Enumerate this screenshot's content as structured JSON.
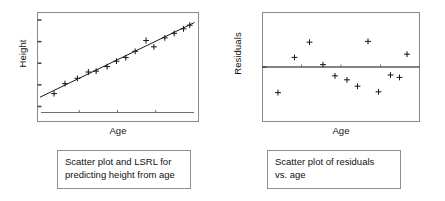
{
  "figure": {
    "stroke_color": "#1a1a1a",
    "frame_color": "#8a8a8a",
    "background": "#ffffff"
  },
  "panels": [
    {
      "id": "scatter-lsrl",
      "xlabel": "Age",
      "ylabel": "Height",
      "caption_line1": "Scatter plot and LSRL for",
      "caption_line2": "predicting height from age"
    },
    {
      "id": "residual-plot",
      "xlabel": "Age",
      "ylabel": "Residuals",
      "caption_line1": "Scatter plot of residuals",
      "caption_line2": "vs. age"
    }
  ],
  "chart_data": [
    {
      "type": "scatter",
      "id": "scatter-lsrl",
      "title": "Scatter plot and LSRL for predicting height from age",
      "xlabel": "Age",
      "ylabel": "Height",
      "xlim": [
        0,
        100
      ],
      "ylim": [
        0,
        100
      ],
      "grid": false,
      "legend": null,
      "axis_ticks": {
        "y_tick_count": 5,
        "x_tick_count": 3,
        "tick_labels_shown": false
      },
      "marker": "plus",
      "points": [
        {
          "x": 9,
          "y": 16
        },
        {
          "x": 16,
          "y": 27
        },
        {
          "x": 24,
          "y": 33
        },
        {
          "x": 31,
          "y": 40
        },
        {
          "x": 36,
          "y": 41
        },
        {
          "x": 43,
          "y": 46
        },
        {
          "x": 49,
          "y": 52
        },
        {
          "x": 55,
          "y": 56
        },
        {
          "x": 61,
          "y": 63
        },
        {
          "x": 68,
          "y": 75
        },
        {
          "x": 73,
          "y": 68
        },
        {
          "x": 80,
          "y": 78
        },
        {
          "x": 86,
          "y": 83
        },
        {
          "x": 92,
          "y": 88
        },
        {
          "x": 96,
          "y": 92
        }
      ],
      "fit_line": {
        "name": "LSRL",
        "x_start": 0,
        "y_start": 12,
        "x_end": 99,
        "y_end": 95
      }
    },
    {
      "type": "scatter",
      "id": "residual-plot",
      "title": "Scatter plot of residuals vs. age",
      "xlabel": "Age",
      "ylabel": "Residuals",
      "xlim": [
        0,
        100
      ],
      "ylim": [
        -50,
        50
      ],
      "grid": false,
      "legend": null,
      "axis_ticks": {
        "y_tick_count": 1,
        "x_tick_count": 3,
        "tick_labels_shown": false
      },
      "marker": "plus",
      "zero_line": 0,
      "points": [
        {
          "x": 8,
          "y": -32
        },
        {
          "x": 19,
          "y": 12
        },
        {
          "x": 29,
          "y": 31
        },
        {
          "x": 38,
          "y": 3
        },
        {
          "x": 46,
          "y": -11
        },
        {
          "x": 54,
          "y": -16
        },
        {
          "x": 61,
          "y": -24
        },
        {
          "x": 68,
          "y": 32
        },
        {
          "x": 75,
          "y": -31
        },
        {
          "x": 83,
          "y": -10
        },
        {
          "x": 89,
          "y": -13
        },
        {
          "x": 94,
          "y": 16
        }
      ]
    }
  ]
}
